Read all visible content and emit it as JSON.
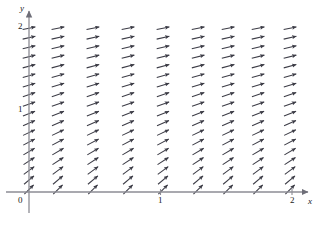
{
  "figure": {
    "kind": "slope-field",
    "background": "#ffffff",
    "stroke_color": "#3c3c46",
    "axis_color": "#8c8c94",
    "text_color": "#1a1a1a"
  },
  "axes": {
    "x_axis_label": "x",
    "y_axis_label": "y",
    "origin_label": "0",
    "x_ticks": [
      {
        "value": 1,
        "label": "1"
      },
      {
        "value": 2,
        "label": "2"
      }
    ],
    "y_ticks": [
      {
        "value": 1,
        "label": "1"
      },
      {
        "value": 2,
        "label": "2"
      }
    ],
    "xlim": [
      0,
      2.18
    ],
    "ylim": [
      0,
      2.18
    ],
    "x_axis_pixel_y": 192,
    "y_axis_pixel_x": 29,
    "x_unit_px": 131.5,
    "y_unit_px": 82.5,
    "minor_tick_count_y": 17,
    "grid": false,
    "arrowheads": [
      "x-positive",
      "y-positive"
    ]
  },
  "chart_data": {
    "type": "scatter",
    "title": "",
    "xlabel": "x",
    "ylabel": "y",
    "xlim": [
      0,
      2.18
    ],
    "ylim": [
      0,
      2.18
    ],
    "grid": false,
    "legend": "none",
    "segment_length_px": 13,
    "columns_x": [
      0,
      0.22,
      0.486,
      0.753,
      1.019,
      1.286,
      1.514,
      1.742,
      1.985
    ],
    "rows_y": [
      0.03,
      0.145,
      0.26,
      0.375,
      0.49,
      0.605,
      0.72,
      0.835,
      0.95,
      1.065,
      1.18,
      1.295,
      1.41,
      1.525,
      1.64,
      1.755,
      1.87,
      1.985
    ],
    "slope_rule": "dy/dx = 1/(1+y)^1.45",
    "slopes_by_row": [
      0.975,
      0.845,
      0.74,
      0.655,
      0.585,
      0.525,
      0.475,
      0.432,
      0.395,
      0.363,
      0.335,
      0.31,
      0.288,
      0.268,
      0.251,
      0.235,
      0.221,
      0.208
    ]
  }
}
